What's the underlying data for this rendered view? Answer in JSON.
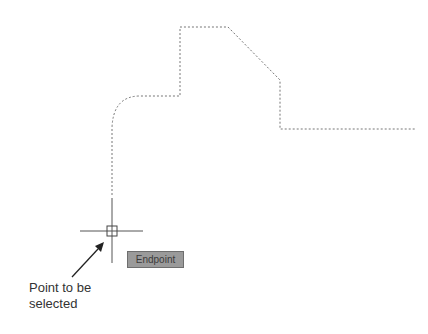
{
  "drawing": {
    "path_style": "dotted",
    "path_color": "#777777",
    "crosshair_color": "#555555"
  },
  "snap_tooltip": {
    "label": "Endpoint"
  },
  "annotation": {
    "line1": "Point to be",
    "line2": "selected"
  },
  "icons": {
    "cursor": "crosshair-with-aperture-box",
    "arrow": "pointer-arrow"
  }
}
